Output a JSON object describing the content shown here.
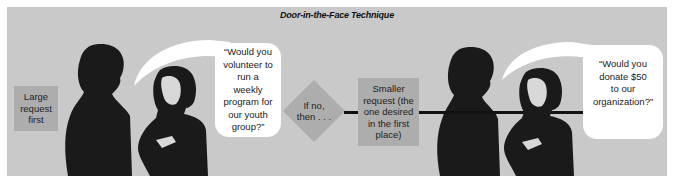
{
  "diagram": {
    "title": "Door-in-the-Face Technique",
    "steps": [
      {
        "label": "Large request first",
        "lines": [
          "Large",
          "request",
          "first"
        ]
      },
      {
        "label": "If no, then . . .",
        "lines": [
          "If no,",
          "then . . ."
        ]
      },
      {
        "label": "Smaller request (the one desired in the first place)",
        "lines": [
          "Smaller",
          "request (the",
          "one desired",
          "in the first",
          "place)"
        ]
      }
    ],
    "speech_bubbles": [
      {
        "text": "“Would you volunteer to run a weekly program for our youth group?”",
        "lines": [
          "“Would you",
          "volunteer to",
          "run a",
          "weekly",
          "program for",
          "our youth",
          "group?”"
        ]
      },
      {
        "text": "“Would you donate $50 to our organization?”",
        "lines": [
          "“Would you",
          "donate $50",
          "to our",
          "organization?”"
        ]
      }
    ],
    "figures": [
      {
        "name": "man-silhouette-left"
      },
      {
        "name": "woman-left"
      },
      {
        "name": "man-silhouette-right"
      },
      {
        "name": "woman-right"
      }
    ],
    "colors": {
      "background": "#c9c9c9",
      "box": "#adadad",
      "bubble": "#ffffff",
      "silhouette": "#1a1a1a",
      "arrow": "#111111"
    }
  }
}
